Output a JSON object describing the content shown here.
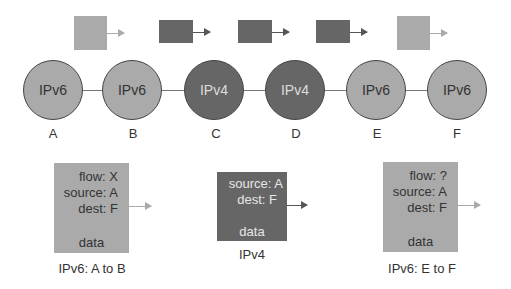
{
  "colors": {
    "ipv6_fill": "#aaaaaa",
    "ipv4_fill": "#666666",
    "line": "#777777",
    "text": "#333333"
  },
  "top_packets": [
    {
      "type": "ipv6",
      "shade": "light"
    },
    {
      "type": "ipv4",
      "shade": "dark"
    },
    {
      "type": "ipv4",
      "shade": "dark"
    },
    {
      "type": "ipv4",
      "shade": "dark"
    },
    {
      "type": "ipv6",
      "shade": "light"
    }
  ],
  "nodes": [
    {
      "id": "A",
      "protocol": "IPv6"
    },
    {
      "id": "B",
      "protocol": "IPv6"
    },
    {
      "id": "C",
      "protocol": "IPv4"
    },
    {
      "id": "D",
      "protocol": "IPv4"
    },
    {
      "id": "E",
      "protocol": "IPv6"
    },
    {
      "id": "F",
      "protocol": "IPv6"
    }
  ],
  "packets": [
    {
      "flow": "flow: X",
      "source": "source: A",
      "dest": "dest: F",
      "data": "data",
      "caption": "IPv6: A to B"
    },
    {
      "source": "source: A",
      "dest": "dest: F",
      "data": "data",
      "caption": "IPv4"
    },
    {
      "flow": "flow: ?",
      "source": "source: A",
      "dest": "dest: F",
      "data": "data",
      "caption": "IPv6: E to F"
    }
  ]
}
